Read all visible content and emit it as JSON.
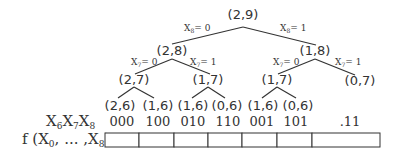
{
  "tree": {
    "root": "(2,9)",
    "level1": {
      "left": "(2,8)",
      "right": "(1,8)"
    },
    "level1_edges": {
      "left": {
        "var": "X",
        "sub": "8",
        "val": "= 0"
      },
      "right": {
        "var": "X",
        "sub": "8",
        "val": "= 1"
      }
    },
    "level2": {
      "ll": "(2,7)",
      "lr": "(1,7)",
      "rl": "(1,7)",
      "rr": "(0,7)"
    },
    "level2_edges": {
      "ll": {
        "var": "X",
        "sub": "7",
        "val": "= 0"
      },
      "lr": {
        "var": "X",
        "sub": "7",
        "val": "= 1"
      },
      "rl": {
        "var": "X",
        "sub": "7",
        "val": "= 0"
      },
      "rr": {
        "var": "X",
        "sub": "7",
        "val": "= 1"
      }
    },
    "leaves": [
      "(2,6)",
      "(1,6)",
      "(1,6)",
      "(0,6)",
      "(1,6)",
      "(0,6)"
    ]
  },
  "codes_row": {
    "label_vars": [
      {
        "var": "X",
        "sub": "6"
      },
      {
        "var": "X",
        "sub": "7"
      },
      {
        "var": "X",
        "sub": "8"
      }
    ],
    "codes": [
      "000",
      "100",
      "010",
      "110",
      "001",
      "101",
      ".11"
    ]
  },
  "function_row": {
    "label_prefix": "f (X",
    "label_sub0": "0",
    "label_mid": ", ... ,X",
    "label_sub8": "8",
    "label_suffix": ")",
    "cell_count": 7
  }
}
